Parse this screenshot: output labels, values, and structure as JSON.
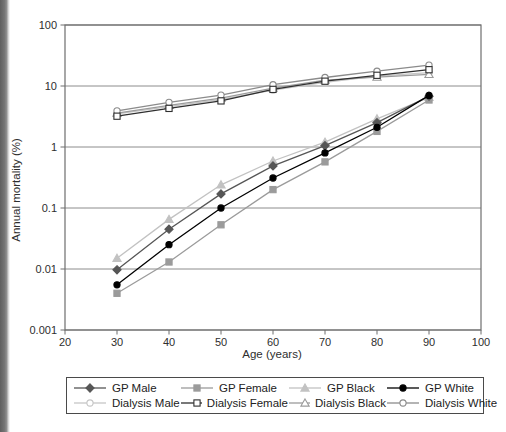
{
  "page": {
    "background": "#ffffff",
    "scan_edge_color": "#5f5f5f"
  },
  "chart_data": {
    "type": "line",
    "title": "",
    "xlabel": "Age (years)",
    "ylabel": "Annual mortality (%)",
    "x_scale": "linear",
    "y_scale": "log",
    "xlim": [
      20,
      100
    ],
    "ylim": [
      0.001,
      100
    ],
    "x_ticks": [
      20,
      30,
      40,
      50,
      60,
      70,
      80,
      90,
      100
    ],
    "y_ticks": [
      100,
      10,
      1,
      0.1,
      0.01,
      0.001
    ],
    "y_tick_labels": [
      "100",
      "10",
      "1",
      "0.1",
      "0.01",
      "0.001"
    ],
    "grid": "horizontal-only",
    "grid_color": "#8c8c8c",
    "axis_color": "#6e6e6e",
    "legend_position": "bottom",
    "x": [
      30,
      40,
      50,
      60,
      70,
      80,
      90
    ],
    "series": [
      {
        "name": "GP Male",
        "marker": "diamond",
        "fill": "filled",
        "color": "#565656",
        "values": [
          0.0097,
          0.045,
          0.17,
          0.49,
          1.05,
          2.5,
          6.8
        ]
      },
      {
        "name": "GP Female",
        "marker": "square",
        "fill": "filled",
        "color": "#9b9b9b",
        "values": [
          0.004,
          0.013,
          0.053,
          0.2,
          0.57,
          1.8,
          5.9
        ]
      },
      {
        "name": "GP Black",
        "marker": "triangle",
        "fill": "filled",
        "color": "#c2c2c2",
        "values": [
          0.015,
          0.065,
          0.24,
          0.59,
          1.2,
          2.9,
          6.5
        ]
      },
      {
        "name": "GP White",
        "marker": "circle",
        "fill": "filled",
        "color": "#000000",
        "values": [
          0.0055,
          0.025,
          0.1,
          0.31,
          0.8,
          2.1,
          7.0
        ]
      },
      {
        "name": "Dialysis Male",
        "marker": "circle",
        "fill": "open",
        "color": "#c6c6c6",
        "values": [
          3.5,
          4.6,
          6.0,
          8.6,
          11.5,
          14.5,
          16.5
        ]
      },
      {
        "name": "Dialysis Female",
        "marker": "square",
        "fill": "open",
        "color": "#2f2f2f",
        "values": [
          3.2,
          4.3,
          5.7,
          8.8,
          12.0,
          15.0,
          18.5
        ]
      },
      {
        "name": "Dialysis Black",
        "marker": "triangle",
        "fill": "open",
        "color": "#9b9b9b",
        "values": [
          3.6,
          4.8,
          6.3,
          9.2,
          12.5,
          14.0,
          15.5
        ]
      },
      {
        "name": "Dialysis White",
        "marker": "circle",
        "fill": "open",
        "color": "#8b8b8b",
        "values": [
          3.9,
          5.4,
          7.1,
          10.5,
          13.8,
          17.5,
          22.0
        ]
      }
    ]
  }
}
